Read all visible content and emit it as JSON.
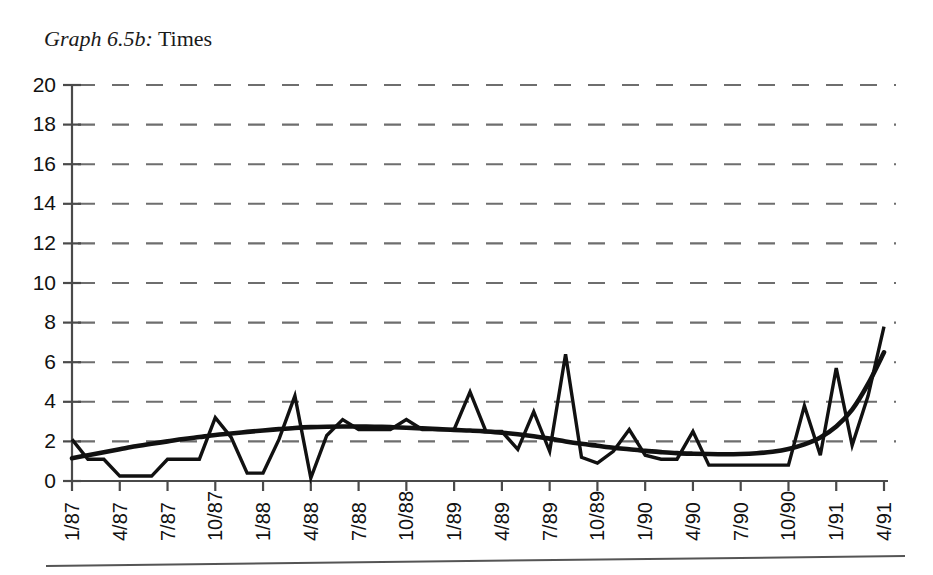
{
  "title": {
    "prefix": "Graph 6.5b:",
    "suffix": " Times"
  },
  "chart_data": {
    "type": "line",
    "title": "Graph 6.5b: Times",
    "xlabel": "",
    "ylabel": "",
    "ylim": [
      0,
      20
    ],
    "ytick_step": 2,
    "yticks": [
      "0",
      "2",
      "4",
      "6",
      "8",
      "10",
      "12",
      "14",
      "16",
      "18",
      "20"
    ],
    "grid": "horizontal-dashed",
    "legend": "none",
    "xtick_labels": [
      "1/87",
      "4/87",
      "7/87",
      "10/87",
      "1/88",
      "4/88",
      "7/88",
      "10/88",
      "1/89",
      "4/89",
      "7/89",
      "10/89",
      "1/90",
      "4/90",
      "7/90",
      "10/90",
      "1/91",
      "4/91"
    ],
    "xtick_rotation_deg": -90,
    "x_points": [
      "1/87",
      "2/87",
      "3/87",
      "4/87",
      "5/87",
      "6/87",
      "7/87",
      "8/87",
      "9/87",
      "10/87",
      "11/87",
      "12/87",
      "1/88",
      "2/88",
      "3/88",
      "4/88",
      "5/88",
      "6/88",
      "7/88",
      "8/88",
      "9/88",
      "10/88",
      "11/88",
      "12/88",
      "1/89",
      "2/89",
      "3/89",
      "4/89",
      "5/89",
      "6/89",
      "7/89",
      "8/89",
      "9/89",
      "10/89",
      "11/89",
      "12/89",
      "1/90",
      "2/90",
      "3/90",
      "4/90",
      "5/90",
      "6/90",
      "7/90",
      "8/90",
      "9/90",
      "10/90",
      "11/90",
      "12/90",
      "1/91",
      "2/91",
      "3/91",
      "4/91"
    ],
    "series": [
      {
        "name": "Times",
        "style": "monthly-observations",
        "values": [
          2.1,
          1.1,
          1.1,
          0.25,
          0.25,
          0.25,
          1.1,
          1.1,
          1.1,
          3.2,
          2.2,
          0.4,
          0.4,
          2.1,
          4.3,
          0.15,
          2.3,
          3.1,
          2.6,
          2.6,
          2.6,
          3.1,
          2.6,
          2.6,
          2.6,
          4.5,
          2.5,
          2.5,
          1.6,
          3.5,
          1.5,
          6.4,
          1.2,
          0.9,
          1.5,
          2.6,
          1.3,
          1.1,
          1.1,
          2.5,
          0.8,
          0.8,
          0.8,
          0.8,
          0.8,
          0.8,
          3.8,
          1.3,
          5.7,
          1.8,
          4.3,
          7.8
        ]
      },
      {
        "name": "Trend",
        "style": "smoothed-trend",
        "values": [
          1.15,
          1.3,
          1.45,
          1.6,
          1.75,
          1.88,
          2.0,
          2.12,
          2.22,
          2.32,
          2.4,
          2.48,
          2.55,
          2.62,
          2.68,
          2.72,
          2.74,
          2.75,
          2.75,
          2.74,
          2.72,
          2.69,
          2.66,
          2.62,
          2.58,
          2.55,
          2.5,
          2.44,
          2.36,
          2.26,
          2.14,
          2.0,
          1.88,
          1.78,
          1.68,
          1.6,
          1.52,
          1.46,
          1.41,
          1.38,
          1.36,
          1.35,
          1.36,
          1.4,
          1.48,
          1.62,
          1.85,
          2.2,
          2.75,
          3.6,
          4.9,
          6.5
        ]
      }
    ]
  },
  "axis_geometry": {
    "plot_left_px": 72,
    "plot_right_px": 884,
    "plot_top_px": 85,
    "plot_bottom_px": 481,
    "months_span": 51
  }
}
